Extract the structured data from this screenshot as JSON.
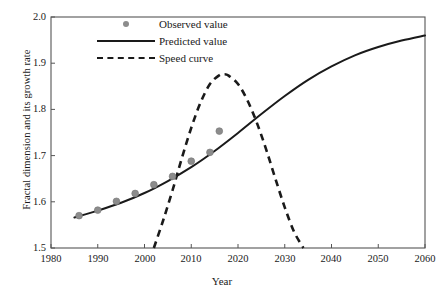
{
  "chart_data": {
    "type": "line",
    "title": "",
    "xlabel": "Year",
    "ylabel": "Fractal dimension and its growth rate",
    "xlim": [
      1980,
      2060
    ],
    "ylim": [
      1.5,
      2.0
    ],
    "xticks": [
      1980,
      1990,
      2000,
      2010,
      2020,
      2030,
      2040,
      2050,
      2060
    ],
    "yticks": [
      "1.5",
      "1.6",
      "1.7",
      "1.8",
      "1.9",
      "2.0"
    ],
    "grid": false,
    "legend_position": "top-left-inside",
    "legend": [
      {
        "label": "Observed value",
        "marker": "circle",
        "color": "#8c8c8c"
      },
      {
        "label": "Predicted value",
        "marker": "solid-line",
        "color": "#1a1a1a"
      },
      {
        "label": "Speed curve",
        "marker": "dashed-line",
        "color": "#1a1a1a"
      }
    ],
    "series": [
      {
        "name": "Observed value",
        "type": "scatter",
        "color": "#8c8c8c",
        "x": [
          1986,
          1990,
          1994,
          1998,
          2002,
          2006,
          2010,
          2014,
          2016
        ],
        "y": [
          1.57,
          1.582,
          1.601,
          1.618,
          1.637,
          1.655,
          1.688,
          1.707,
          1.753
        ]
      },
      {
        "name": "Predicted value",
        "type": "line",
        "color": "#1a1a1a",
        "x": [
          1985,
          1990,
          1995,
          2000,
          2005,
          2010,
          2015,
          2020,
          2025,
          2030,
          2035,
          2040,
          2045,
          2050,
          2055,
          2060
        ],
        "y": [
          1.566,
          1.581,
          1.598,
          1.619,
          1.645,
          1.675,
          1.71,
          1.749,
          1.79,
          1.829,
          1.864,
          1.893,
          1.917,
          1.935,
          1.949,
          1.96
        ]
      },
      {
        "name": "Speed curve",
        "type": "line",
        "dashed": true,
        "color": "#1a1a1a",
        "x": [
          2002,
          2004,
          2006,
          2008,
          2010,
          2012,
          2014,
          2016,
          2017,
          2018,
          2020,
          2022,
          2024,
          2026,
          2028,
          2030,
          2032,
          2034
        ],
        "y": [
          1.5,
          1.56,
          1.625,
          1.695,
          1.76,
          1.815,
          1.855,
          1.874,
          1.876,
          1.873,
          1.855,
          1.82,
          1.772,
          1.714,
          1.65,
          1.588,
          1.535,
          1.5
        ]
      }
    ]
  }
}
